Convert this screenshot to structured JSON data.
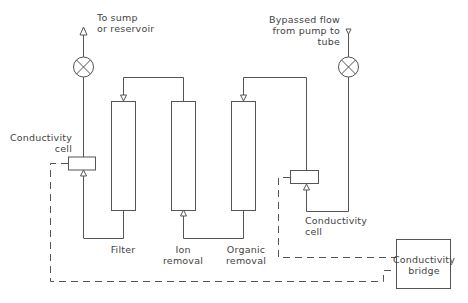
{
  "labels": {
    "sump": "To sump\nor reservoir",
    "bypass": "Bypassed flow\nfrom pump to\ntube",
    "cell_left": "Conductivity\ncell",
    "cell_right": "Conductivity\ncell",
    "filter": "Filter",
    "ion": "Ion\nremoval",
    "organic": "Organic\nremoval",
    "bridge": "Conductivity\nbridge"
  },
  "colors": {
    "line": "#555555",
    "text": "#444444",
    "background": "#ffffff"
  }
}
